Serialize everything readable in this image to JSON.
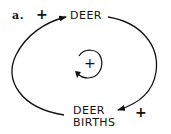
{
  "diagram": {
    "panel_label": "a.",
    "nodes": [
      {
        "id": "deer",
        "label": "DEER"
      },
      {
        "id": "deer_births",
        "label_line1": "DEER",
        "label_line2": "BIRTHS"
      }
    ],
    "links": [
      {
        "from": "deer",
        "to": "deer_births",
        "polarity": "+"
      },
      {
        "from": "deer_births",
        "to": "deer",
        "polarity": "+"
      }
    ],
    "loop": {
      "type": "reinforcing",
      "symbol": "+"
    },
    "colors": {
      "stroke": "#111111",
      "background": "#ffffff"
    }
  }
}
